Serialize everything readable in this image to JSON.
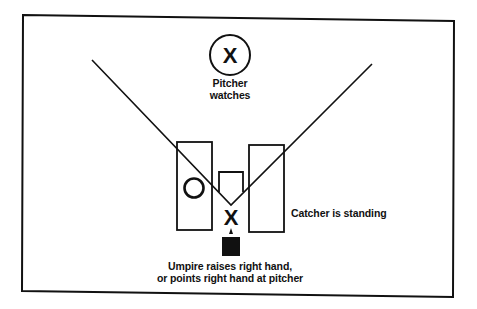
{
  "diagram": {
    "colors": {
      "ink": "#111111",
      "background": "#ffffff"
    },
    "symbols": {
      "pitcher_mark": "X",
      "catcher_mark": "X",
      "batter_mark": "O"
    },
    "labels": {
      "pitcher": {
        "line1": "Pitcher",
        "line2": "watches"
      },
      "catcher": "Catcher is standing",
      "umpire": {
        "line1": "Umpire raises right hand,",
        "line2": "or points right hand at pitcher"
      }
    }
  }
}
